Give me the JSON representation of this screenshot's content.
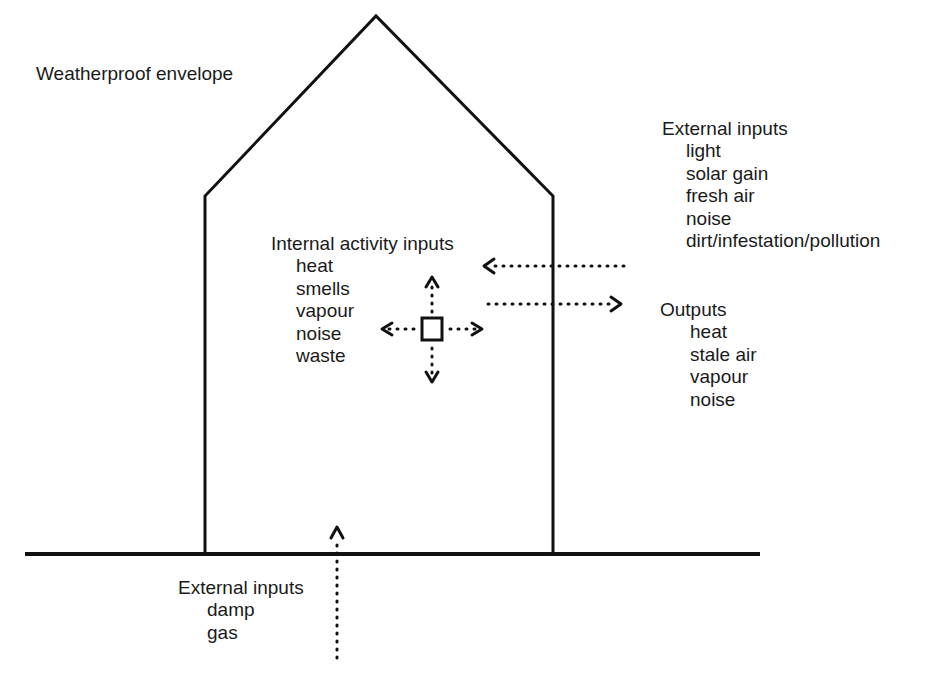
{
  "diagram": {
    "title_label": "Weatherproof envelope",
    "internal": {
      "heading": "Internal activity inputs",
      "items": [
        "heat",
        "smells",
        "vapour",
        "noise",
        "waste"
      ]
    },
    "external_top": {
      "heading": "External inputs",
      "items": [
        "light",
        "solar gain",
        "fresh air",
        "noise",
        "dirt/infestation/pollution"
      ]
    },
    "outputs": {
      "heading": "Outputs",
      "items": [
        "heat",
        "stale air",
        "vapour",
        "noise"
      ]
    },
    "external_bottom": {
      "heading": "External inputs",
      "items": [
        "damp",
        "gas"
      ]
    },
    "colors": {
      "stroke": "#111111",
      "text": "#1a1a1a",
      "background": "#ffffff"
    },
    "shapes": {
      "house_outline": "house-envelope",
      "ground_line": "ground",
      "activity_source": "square",
      "arrows": [
        "internal-up",
        "internal-down",
        "internal-left",
        "internal-right",
        "external-inflow-left",
        "outflow-right",
        "ground-inflow-up"
      ]
    }
  }
}
